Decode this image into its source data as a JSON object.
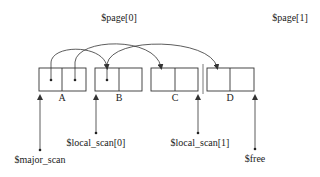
{
  "pages": [
    {
      "label": "$page[0]",
      "x": 119,
      "y": 21
    },
    {
      "label": "$page[1]",
      "x": 290,
      "y": 21
    }
  ],
  "blocks": [
    {
      "label": "A",
      "x": 39,
      "divider": 62,
      "x2": 86
    },
    {
      "label": "B",
      "x": 95,
      "divider": 119,
      "x2": 142
    },
    {
      "label": "C",
      "x": 151,
      "divider": 175,
      "x2": 198
    },
    {
      "label": "D",
      "x": 207,
      "divider": 230,
      "x2": 254
    }
  ],
  "pointers": [
    {
      "label": "$major_scan",
      "x": 40,
      "from_y": 150,
      "label_x": 40,
      "label_y": 163
    },
    {
      "label": "$local_scan[0]",
      "x": 96,
      "from_y": 133,
      "label_x": 96,
      "label_y": 146
    },
    {
      "label": "$local_scan[1]",
      "x": 198,
      "from_y": 133,
      "label_x": 200,
      "label_y": 146
    },
    {
      "label": "$free",
      "x": 255,
      "from_y": 149,
      "label_x": 255,
      "label_y": 162
    }
  ],
  "references": [
    {
      "from": "A.left",
      "to": "B"
    },
    {
      "from": "A.right",
      "to": "C"
    },
    {
      "from": "B.left",
      "to": "D"
    }
  ],
  "colors": {
    "stroke": "#333333",
    "text": "#222222",
    "background": "#ffffff"
  }
}
